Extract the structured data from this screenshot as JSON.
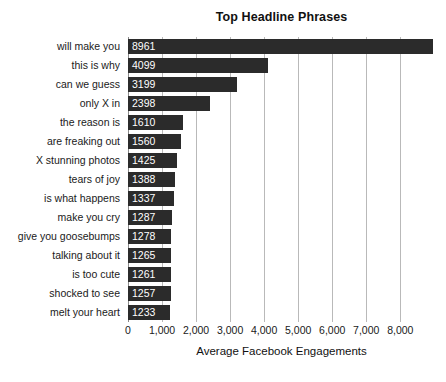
{
  "chart_data": {
    "type": "bar",
    "orientation": "horizontal",
    "title": "Top Headline Phrases",
    "xlabel": "Average Facebook Engagements",
    "ylabel": "",
    "grid": true,
    "legend": null,
    "xlim": [
      0,
      9020
    ],
    "xticks": [
      0,
      1000,
      2000,
      3000,
      4000,
      5000,
      6000,
      7000,
      8000
    ],
    "xtick_labels": [
      "0",
      "1,000",
      "2,000",
      "3,000",
      "4,000",
      "5,000",
      "6,000",
      "7,000",
      "8,000"
    ],
    "categories": [
      "will make you",
      "this is why",
      "can we guess",
      "only X in",
      "the reason is",
      "are freaking out",
      "X stunning photos",
      "tears of joy",
      "is what happens",
      "make you cry",
      "give you goosebumps",
      "talking about it",
      "is too cute",
      "shocked to see",
      "melt your heart"
    ],
    "values": [
      8961,
      4099,
      3199,
      2398,
      1610,
      1560,
      1425,
      1388,
      1337,
      1287,
      1278,
      1265,
      1261,
      1257,
      1233
    ],
    "value_labels": [
      "8961",
      "4099",
      "3199",
      "2398",
      "1610",
      "1560",
      "1425",
      "1388",
      "1337",
      "1287",
      "1278",
      "1265",
      "1261",
      "1257",
      "1233"
    ],
    "bar_color": "#2b2b2b",
    "value_label_color": "#ffffff",
    "grid_color": "#b9b9b9",
    "background_color": "#ffffff"
  }
}
